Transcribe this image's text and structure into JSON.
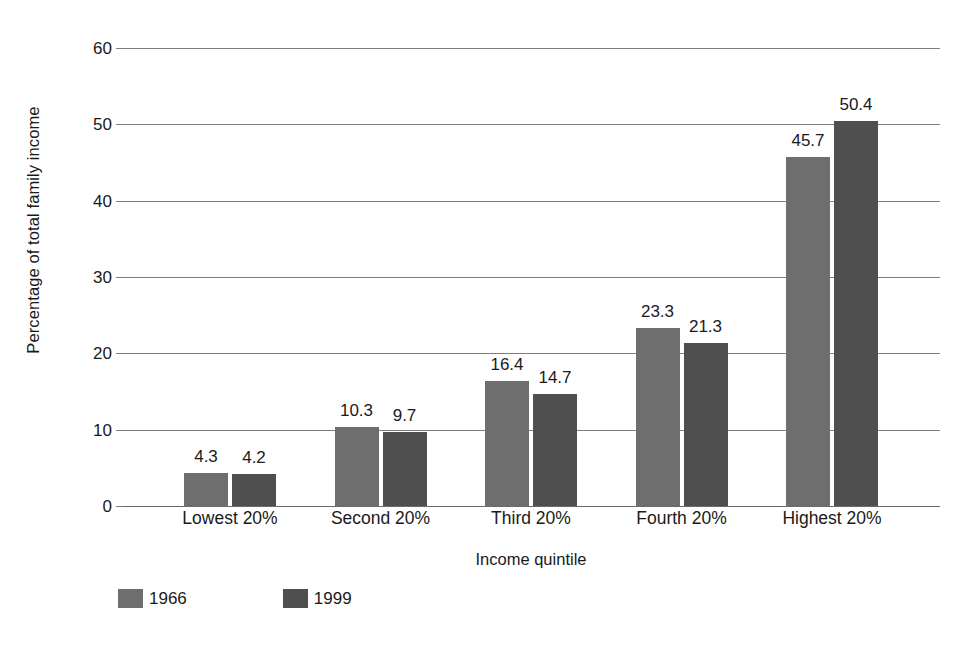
{
  "chart_data": {
    "type": "bar",
    "title": "",
    "xlabel": "Income quintile",
    "ylabel": "Percentage of total family income",
    "categories": [
      "Lowest 20%",
      "Second 20%",
      "Third 20%",
      "Fourth 20%",
      "Highest 20%"
    ],
    "series": [
      {
        "name": "1966",
        "color": "#6e6e6e",
        "values": [
          4.3,
          10.3,
          16.4,
          23.3,
          45.7
        ]
      },
      {
        "name": "1999",
        "color": "#4f4f4f",
        "values": [
          4.2,
          9.7,
          14.7,
          21.3,
          50.4
        ]
      }
    ],
    "ylim": [
      0,
      60
    ],
    "yticks": [
      0,
      10,
      20,
      30,
      40,
      50,
      60
    ],
    "ytick_labels": [
      "0",
      "10",
      "20",
      "30",
      "40",
      "50",
      "60"
    ],
    "grid": true,
    "grid_axis": "y",
    "legend_position": "bottom-left",
    "value_labels": true
  }
}
